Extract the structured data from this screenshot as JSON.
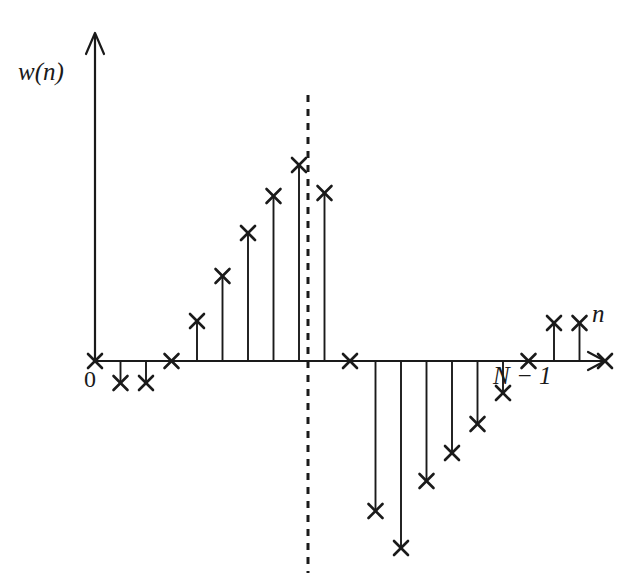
{
  "figure": {
    "type": "stem-plot",
    "background_color": "#ffffff",
    "ink_color": "#1a1a1a",
    "labels": {
      "y_axis": "w(n)",
      "x_axis": "n",
      "origin": "0",
      "end_sample": "N − 1"
    }
  },
  "chart_data": {
    "type": "scatter",
    "title": "",
    "subtitle": "",
    "xlabel": "n",
    "ylabel": "w(n)",
    "marker": "x",
    "stems": true,
    "grid": false,
    "legend": null,
    "axis_style": {
      "x_axis_arrow": true,
      "y_axis_arrow": true,
      "x_axis_origin_n": 0,
      "sample_spacing_px": 25.5,
      "baseline_y_px": 361,
      "origin_x_px": 95
    },
    "annotations": [
      {
        "name": "center-dashed-line",
        "type": "vertical-dashed-line",
        "x_index": 10.5,
        "x_px": 308,
        "y_top_px": 95,
        "y_bottom_px": 573,
        "dash": "7 7"
      },
      {
        "name": "origin-tick-label",
        "text": "0",
        "x_index": 0
      },
      {
        "name": "end-sample-label",
        "text": "N − 1",
        "x_index": 20
      }
    ],
    "xlabel_ticks": [
      "0",
      "N − 1"
    ],
    "x": [
      0,
      1,
      2,
      3,
      4,
      5,
      6,
      7,
      8,
      9,
      10,
      11,
      12,
      13,
      14,
      15,
      16,
      17,
      18,
      19,
      20
    ],
    "values_px": [
      0,
      -22,
      -22,
      0,
      40,
      85,
      128,
      165,
      196,
      168,
      0,
      -150,
      -187,
      -120,
      -92,
      -63,
      -32,
      0,
      38,
      38,
      0
    ],
    "y": [
      0,
      -0.11,
      -0.11,
      0,
      0.2,
      0.43,
      0.65,
      0.84,
      1.0,
      0.86,
      0,
      -0.76,
      -0.95,
      -0.61,
      -0.47,
      -0.32,
      -0.16,
      0,
      0.19,
      0.19,
      0
    ],
    "ylim": [
      -1.0,
      1.05
    ],
    "xlim": [
      -0.5,
      20.5
    ],
    "points": [
      {
        "n": 0,
        "value": 0.0
      },
      {
        "n": 1,
        "value": -0.11
      },
      {
        "n": 2,
        "value": -0.11
      },
      {
        "n": 3,
        "value": 0.0
      },
      {
        "n": 4,
        "value": 0.2
      },
      {
        "n": 5,
        "value": 0.43
      },
      {
        "n": 6,
        "value": 0.65
      },
      {
        "n": 7,
        "value": 0.84
      },
      {
        "n": 8,
        "value": 1.0
      },
      {
        "n": 9,
        "value": 0.86
      },
      {
        "n": 10,
        "value": 0.0
      },
      {
        "n": 11,
        "value": -0.76
      },
      {
        "n": 12,
        "value": -0.95
      },
      {
        "n": 13,
        "value": -0.61
      },
      {
        "n": 14,
        "value": -0.47
      },
      {
        "n": 15,
        "value": -0.32
      },
      {
        "n": 16,
        "value": -0.16
      },
      {
        "n": 17,
        "value": 0.0
      },
      {
        "n": 18,
        "value": 0.19
      },
      {
        "n": 19,
        "value": 0.19
      },
      {
        "n": 20,
        "value": 0.0
      }
    ]
  }
}
